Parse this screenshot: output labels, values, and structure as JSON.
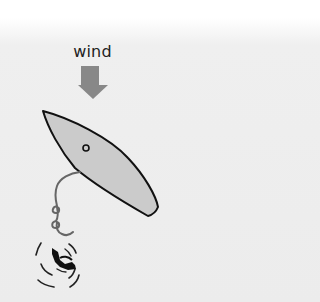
{
  "diagram": {
    "wind_label": "wind",
    "colors": {
      "background_top": "#ffffff",
      "background": "#ececec",
      "wind_arrow": "#888888",
      "boat_fill": "#cbcbcb",
      "boat_outline": "#111111",
      "rope": "#666666",
      "swimmer": "#111111"
    },
    "elements": [
      {
        "id": "wind-arrow",
        "description": "downward arrow indicating wind direction"
      },
      {
        "id": "sailboat",
        "description": "boat hull seen from above, bow pointing up-left"
      },
      {
        "id": "throw-line",
        "description": "coiled rope from boat to person"
      },
      {
        "id": "person-in-water",
        "description": "swimmer surrounded by ripples"
      }
    ]
  }
}
